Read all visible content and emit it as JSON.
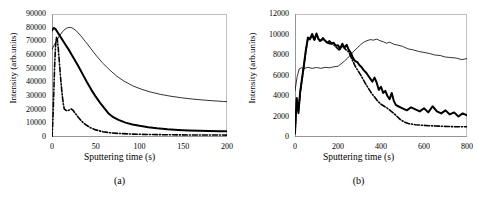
{
  "figure": {
    "background": "#ffffff",
    "frame_color": "#bfbfbf",
    "curve_color": "#000000"
  },
  "chart_data": [
    {
      "type": "line",
      "panel": "a",
      "caption": "(a)",
      "title": "",
      "xlabel": "Sputtering time (s)",
      "ylabel": "Intensity (arb.units)",
      "xlim": [
        0,
        200
      ],
      "ylim": [
        0,
        90000
      ],
      "xticks": [
        0,
        50,
        100,
        150,
        200
      ],
      "yticks": [
        0,
        10000,
        20000,
        30000,
        40000,
        50000,
        60000,
        70000,
        80000,
        90000
      ],
      "grid": false,
      "legend": "none",
      "series": [
        {
          "name": "thin-line",
          "style": "solid-thin",
          "x": [
            0,
            3,
            6,
            9,
            12,
            15,
            18,
            21,
            24,
            28,
            33,
            38,
            44,
            50,
            58,
            66,
            74,
            82,
            92,
            102,
            112,
            124,
            136,
            148,
            160,
            172,
            184,
            196,
            200
          ],
          "values": [
            64000,
            68000,
            71500,
            74500,
            77000,
            79000,
            80000,
            80200,
            79500,
            77500,
            74000,
            70000,
            65000,
            60000,
            54000,
            49000,
            44500,
            41000,
            37500,
            35000,
            33000,
            31200,
            29800,
            28700,
            27800,
            27100,
            26500,
            26000,
            25900
          ]
        },
        {
          "name": "thick-line",
          "style": "solid-thick",
          "x": [
            0,
            2,
            4,
            6,
            9,
            12,
            16,
            20,
            25,
            30,
            35,
            40,
            45,
            50,
            55,
            60,
            65,
            70,
            76,
            84,
            92,
            100,
            110,
            120,
            132,
            144,
            156,
            168,
            180,
            192,
            200
          ],
          "values": [
            78000,
            79800,
            79000,
            77000,
            74000,
            71000,
            67000,
            63000,
            57500,
            52000,
            46000,
            40000,
            34500,
            29500,
            25000,
            21000,
            17000,
            14500,
            12500,
            10500,
            9200,
            8200,
            7200,
            6400,
            5700,
            5200,
            4800,
            4500,
            4300,
            4200,
            4200
          ]
        },
        {
          "name": "dash-dot-line",
          "style": "dash-dot",
          "x": [
            0,
            1,
            2,
            3,
            4,
            5,
            6,
            7,
            8,
            9,
            10,
            11,
            12,
            13,
            14,
            16,
            18,
            20,
            22,
            24,
            27,
            30,
            34,
            38,
            44,
            50,
            58,
            66,
            76,
            88,
            100,
            115,
            130,
            145,
            160,
            175,
            190,
            200
          ],
          "values": [
            0,
            12000,
            32000,
            52000,
            66000,
            73000,
            72000,
            66000,
            58000,
            50000,
            42000,
            35000,
            29000,
            24000,
            20500,
            19500,
            19200,
            19800,
            20500,
            19500,
            17000,
            14500,
            11500,
            9200,
            6800,
            5200,
            3900,
            3100,
            2600,
            2200,
            2000,
            1800,
            1650,
            1550,
            1500,
            1450,
            1420,
            1400
          ]
        }
      ]
    },
    {
      "type": "line",
      "panel": "b",
      "caption": "(b)",
      "title": "",
      "xlabel": "Sputtering time (s)",
      "ylabel": "Intensity (arb.units)",
      "xlim": [
        0,
        800
      ],
      "ylim": [
        0,
        12000
      ],
      "xticks": [
        0,
        200,
        400,
        600,
        800
      ],
      "yticks": [
        0,
        2000,
        4000,
        6000,
        8000,
        10000,
        12000
      ],
      "grid": false,
      "legend": "none",
      "series": [
        {
          "name": "thin-line",
          "style": "solid-thin",
          "x": [
            0,
            10,
            20,
            30,
            45,
            60,
            80,
            100,
            120,
            140,
            160,
            180,
            200,
            215,
            230,
            245,
            260,
            275,
            290,
            305,
            320,
            335,
            350,
            365,
            380,
            395,
            410,
            425,
            440,
            460,
            480,
            500,
            525,
            550,
            575,
            600,
            625,
            650,
            675,
            700,
            725,
            750,
            775,
            800
          ],
          "values": [
            4500,
            5900,
            6650,
            6750,
            6700,
            6800,
            6700,
            6780,
            6700,
            6800,
            6750,
            6850,
            6900,
            7150,
            7400,
            7700,
            8050,
            8400,
            8700,
            9000,
            9250,
            9400,
            9500,
            9450,
            9550,
            9400,
            9300,
            9150,
            9250,
            9050,
            8950,
            8850,
            8600,
            8500,
            8350,
            8250,
            8150,
            8000,
            7950,
            7800,
            7750,
            7700,
            7550,
            7650
          ]
        },
        {
          "name": "thick-line",
          "style": "solid-thick",
          "x": [
            0,
            8,
            16,
            24,
            32,
            40,
            50,
            60,
            70,
            80,
            90,
            100,
            110,
            120,
            130,
            140,
            150,
            160,
            170,
            180,
            190,
            200,
            210,
            220,
            230,
            240,
            250,
            260,
            270,
            280,
            290,
            300,
            310,
            320,
            330,
            340,
            350,
            360,
            370,
            380,
            390,
            400,
            410,
            420,
            430,
            440,
            450,
            460,
            470,
            480,
            500,
            520,
            540,
            560,
            580,
            600,
            620,
            640,
            660,
            680,
            700,
            720,
            740,
            760,
            780,
            800
          ],
          "values": [
            400,
            3800,
            2400,
            4400,
            5600,
            6800,
            8400,
            9700,
            9600,
            10050,
            9500,
            10100,
            9500,
            9400,
            9650,
            9400,
            9200,
            9350,
            9100,
            9200,
            8900,
            8950,
            8600,
            9100,
            8700,
            9000,
            8500,
            8200,
            7700,
            7400,
            7300,
            7000,
            6800,
            6500,
            6300,
            6000,
            5700,
            5400,
            5800,
            5300,
            4600,
            4900,
            4300,
            4500,
            4000,
            3700,
            4300,
            3500,
            3100,
            3000,
            2800,
            2600,
            2900,
            2700,
            2500,
            2800,
            2400,
            3000,
            2500,
            2300,
            2600,
            2200,
            2400,
            2000,
            2300,
            2100
          ]
        },
        {
          "name": "dash-dot-line",
          "style": "dash-dot",
          "x": [
            0,
            8,
            16,
            24,
            32,
            40,
            50,
            60,
            70,
            80,
            90,
            100,
            115,
            130,
            145,
            160,
            175,
            190,
            205,
            220,
            235,
            250,
            265,
            280,
            295,
            310,
            325,
            340,
            355,
            370,
            385,
            400,
            415,
            430,
            445,
            460,
            475,
            490,
            510,
            530,
            560,
            590,
            620,
            650,
            680,
            710,
            740,
            770,
            800
          ],
          "values": [
            300,
            3600,
            2300,
            4300,
            5500,
            6700,
            8300,
            9600,
            9500,
            9950,
            9400,
            10000,
            9350,
            9550,
            9300,
            9100,
            9100,
            8800,
            8500,
            8900,
            8550,
            8300,
            7600,
            6900,
            6400,
            5900,
            5300,
            4800,
            4300,
            3900,
            3500,
            3200,
            3000,
            2800,
            2550,
            2300,
            2000,
            1700,
            1450,
            1300,
            1200,
            1150,
            1100,
            1080,
            1050,
            1030,
            1000,
            1000,
            1000
          ]
        }
      ]
    }
  ]
}
